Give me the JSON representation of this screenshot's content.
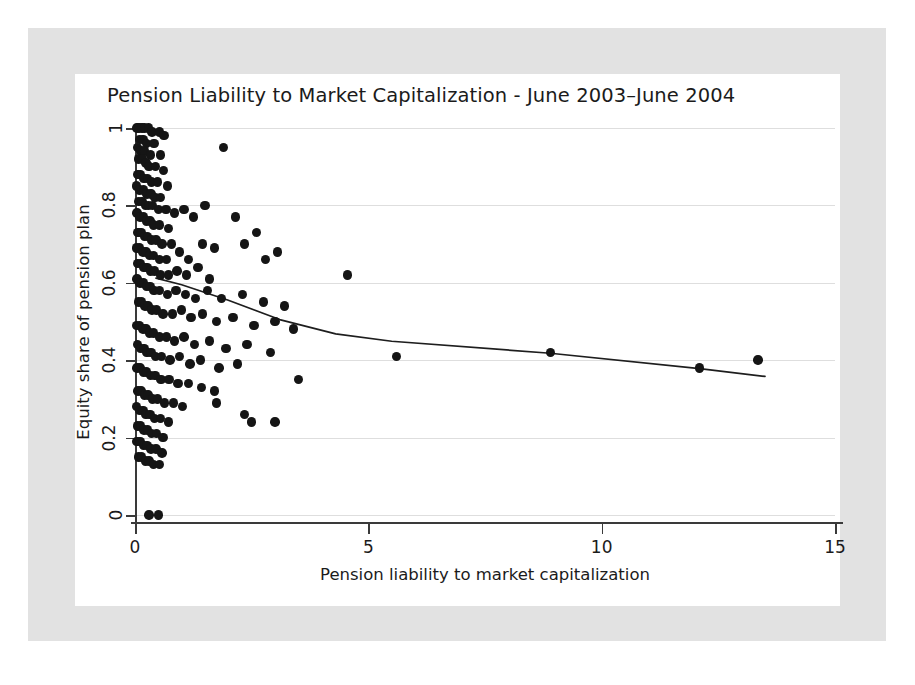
{
  "figure": {
    "title": "Pension Liability to Market Capitalization - June 2003–June 2004"
  },
  "chart_data": {
    "type": "scatter",
    "title": "Pension Liability to Market Capitalization - June 2003–June 2004",
    "xlabel": "Pension liability to market capitalization",
    "ylabel": "Equity share of pension plan",
    "xlim": [
      0,
      15
    ],
    "ylim": [
      0,
      1
    ],
    "xticks": [
      0,
      5,
      10,
      15
    ],
    "xticklabels": [
      "0",
      "5",
      "10",
      "15"
    ],
    "yticks": [
      0,
      0.2,
      0.4,
      0.6,
      0.8,
      1
    ],
    "yticklabels": [
      "0",
      "0.2",
      "0.4",
      "0.6",
      "0.8",
      "1"
    ],
    "grid": "horizontal",
    "legend": "none",
    "marker_color": "#151515",
    "line_color": "#1e1e1e",
    "series": [
      {
        "name": "Firms",
        "type": "scatter",
        "points": [
          [
            0.04,
            1.0
          ],
          [
            0.09,
            1.0
          ],
          [
            0.15,
            1.0
          ],
          [
            0.2,
            1.0
          ],
          [
            0.29,
            1.0
          ],
          [
            0.36,
            0.99
          ],
          [
            0.52,
            0.99
          ],
          [
            0.62,
            0.98
          ],
          [
            0.1,
            0.97
          ],
          [
            0.17,
            0.97
          ],
          [
            0.25,
            0.96
          ],
          [
            0.41,
            0.96
          ],
          [
            0.05,
            0.95
          ],
          [
            0.13,
            0.94
          ],
          [
            0.2,
            0.94
          ],
          [
            0.33,
            0.93
          ],
          [
            0.55,
            0.93
          ],
          [
            1.9,
            0.95
          ],
          [
            0.07,
            0.92
          ],
          [
            0.16,
            0.92
          ],
          [
            0.24,
            0.91
          ],
          [
            0.3,
            0.9
          ],
          [
            0.44,
            0.9
          ],
          [
            0.61,
            0.89
          ],
          [
            0.06,
            0.88
          ],
          [
            0.12,
            0.88
          ],
          [
            0.19,
            0.87
          ],
          [
            0.27,
            0.87
          ],
          [
            0.35,
            0.86
          ],
          [
            0.48,
            0.86
          ],
          [
            0.7,
            0.85
          ],
          [
            0.03,
            0.85
          ],
          [
            0.1,
            0.84
          ],
          [
            0.18,
            0.84
          ],
          [
            0.26,
            0.83
          ],
          [
            0.34,
            0.83
          ],
          [
            0.43,
            0.82
          ],
          [
            0.55,
            0.82
          ],
          [
            0.08,
            0.81
          ],
          [
            0.15,
            0.81
          ],
          [
            0.22,
            0.8
          ],
          [
            0.29,
            0.8
          ],
          [
            0.38,
            0.8
          ],
          [
            0.5,
            0.79
          ],
          [
            0.66,
            0.79
          ],
          [
            0.85,
            0.78
          ],
          [
            0.04,
            0.78
          ],
          [
            0.11,
            0.77
          ],
          [
            0.18,
            0.77
          ],
          [
            0.25,
            0.76
          ],
          [
            0.32,
            0.76
          ],
          [
            0.4,
            0.75
          ],
          [
            0.52,
            0.75
          ],
          [
            0.72,
            0.74
          ],
          [
            1.05,
            0.79
          ],
          [
            1.25,
            0.77
          ],
          [
            1.5,
            0.8
          ],
          [
            2.15,
            0.77
          ],
          [
            2.6,
            0.73
          ],
          [
            0.06,
            0.73
          ],
          [
            0.13,
            0.73
          ],
          [
            0.2,
            0.72
          ],
          [
            0.27,
            0.72
          ],
          [
            0.35,
            0.71
          ],
          [
            0.45,
            0.71
          ],
          [
            0.58,
            0.7
          ],
          [
            0.78,
            0.7
          ],
          [
            0.03,
            0.69
          ],
          [
            0.1,
            0.69
          ],
          [
            0.17,
            0.68
          ],
          [
            0.24,
            0.68
          ],
          [
            0.31,
            0.67
          ],
          [
            0.4,
            0.67
          ],
          [
            0.52,
            0.66
          ],
          [
            0.68,
            0.66
          ],
          [
            0.95,
            0.68
          ],
          [
            1.15,
            0.66
          ],
          [
            1.45,
            0.7
          ],
          [
            1.7,
            0.69
          ],
          [
            2.35,
            0.7
          ],
          [
            2.8,
            0.66
          ],
          [
            3.05,
            0.68
          ],
          [
            0.05,
            0.65
          ],
          [
            0.12,
            0.65
          ],
          [
            0.19,
            0.64
          ],
          [
            0.26,
            0.64
          ],
          [
            0.33,
            0.63
          ],
          [
            0.42,
            0.63
          ],
          [
            0.55,
            0.62
          ],
          [
            0.72,
            0.62
          ],
          [
            0.9,
            0.63
          ],
          [
            1.1,
            0.62
          ],
          [
            1.35,
            0.64
          ],
          [
            1.6,
            0.61
          ],
          [
            4.55,
            0.62
          ],
          [
            0.04,
            0.61
          ],
          [
            0.11,
            0.6
          ],
          [
            0.18,
            0.6
          ],
          [
            0.25,
            0.59
          ],
          [
            0.32,
            0.59
          ],
          [
            0.41,
            0.58
          ],
          [
            0.53,
            0.58
          ],
          [
            0.7,
            0.57
          ],
          [
            0.88,
            0.58
          ],
          [
            1.08,
            0.57
          ],
          [
            1.3,
            0.56
          ],
          [
            1.55,
            0.58
          ],
          [
            1.85,
            0.56
          ],
          [
            2.3,
            0.57
          ],
          [
            2.75,
            0.55
          ],
          [
            3.2,
            0.54
          ],
          [
            0.07,
            0.55
          ],
          [
            0.14,
            0.55
          ],
          [
            0.21,
            0.54
          ],
          [
            0.28,
            0.54
          ],
          [
            0.36,
            0.53
          ],
          [
            0.46,
            0.53
          ],
          [
            0.6,
            0.52
          ],
          [
            0.8,
            0.52
          ],
          [
            1.0,
            0.53
          ],
          [
            1.2,
            0.51
          ],
          [
            1.45,
            0.52
          ],
          [
            1.75,
            0.5
          ],
          [
            2.1,
            0.51
          ],
          [
            2.55,
            0.49
          ],
          [
            3.0,
            0.5
          ],
          [
            3.4,
            0.48
          ],
          [
            5.6,
            0.41
          ],
          [
            8.9,
            0.42
          ],
          [
            12.1,
            0.38
          ],
          [
            13.35,
            0.4
          ],
          [
            0.03,
            0.49
          ],
          [
            0.1,
            0.49
          ],
          [
            0.17,
            0.48
          ],
          [
            0.24,
            0.48
          ],
          [
            0.31,
            0.47
          ],
          [
            0.4,
            0.47
          ],
          [
            0.52,
            0.46
          ],
          [
            0.68,
            0.46
          ],
          [
            0.85,
            0.45
          ],
          [
            1.05,
            0.46
          ],
          [
            1.28,
            0.44
          ],
          [
            1.6,
            0.45
          ],
          [
            1.95,
            0.43
          ],
          [
            2.4,
            0.44
          ],
          [
            2.9,
            0.42
          ],
          [
            0.05,
            0.44
          ],
          [
            0.12,
            0.43
          ],
          [
            0.19,
            0.43
          ],
          [
            0.26,
            0.42
          ],
          [
            0.34,
            0.42
          ],
          [
            0.44,
            0.41
          ],
          [
            0.57,
            0.41
          ],
          [
            0.75,
            0.4
          ],
          [
            0.95,
            0.41
          ],
          [
            1.18,
            0.39
          ],
          [
            1.4,
            0.4
          ],
          [
            1.8,
            0.38
          ],
          [
            2.2,
            0.39
          ],
          [
            3.5,
            0.35
          ],
          [
            0.04,
            0.38
          ],
          [
            0.11,
            0.38
          ],
          [
            0.18,
            0.37
          ],
          [
            0.25,
            0.37
          ],
          [
            0.33,
            0.36
          ],
          [
            0.43,
            0.36
          ],
          [
            0.56,
            0.35
          ],
          [
            0.73,
            0.35
          ],
          [
            0.92,
            0.34
          ],
          [
            1.15,
            0.34
          ],
          [
            1.42,
            0.33
          ],
          [
            1.7,
            0.32
          ],
          [
            0.06,
            0.32
          ],
          [
            0.13,
            0.32
          ],
          [
            0.2,
            0.31
          ],
          [
            0.28,
            0.31
          ],
          [
            0.37,
            0.3
          ],
          [
            0.48,
            0.3
          ],
          [
            0.63,
            0.29
          ],
          [
            0.82,
            0.29
          ],
          [
            1.02,
            0.28
          ],
          [
            1.75,
            0.29
          ],
          [
            0.03,
            0.28
          ],
          [
            0.1,
            0.27
          ],
          [
            0.17,
            0.27
          ],
          [
            0.24,
            0.26
          ],
          [
            0.32,
            0.26
          ],
          [
            0.42,
            0.25
          ],
          [
            0.55,
            0.25
          ],
          [
            0.72,
            0.24
          ],
          [
            2.5,
            0.24
          ],
          [
            3.0,
            0.24
          ],
          [
            0.05,
            0.23
          ],
          [
            0.12,
            0.23
          ],
          [
            0.19,
            0.22
          ],
          [
            0.27,
            0.22
          ],
          [
            0.35,
            0.21
          ],
          [
            0.46,
            0.21
          ],
          [
            0.6,
            0.2
          ],
          [
            2.35,
            0.26
          ],
          [
            0.04,
            0.19
          ],
          [
            0.11,
            0.19
          ],
          [
            0.18,
            0.18
          ],
          [
            0.26,
            0.18
          ],
          [
            0.34,
            0.17
          ],
          [
            0.45,
            0.17
          ],
          [
            0.58,
            0.16
          ],
          [
            0.07,
            0.15
          ],
          [
            0.14,
            0.15
          ],
          [
            0.22,
            0.14
          ],
          [
            0.3,
            0.14
          ],
          [
            0.4,
            0.13
          ],
          [
            0.52,
            0.13
          ],
          [
            0.3,
            0.0
          ],
          [
            0.5,
            0.0
          ]
        ]
      },
      {
        "name": "Mean equity share (binned)",
        "type": "line",
        "points": [
          [
            0.45,
            0.612
          ],
          [
            1.0,
            0.595
          ],
          [
            2.0,
            0.555
          ],
          [
            3.1,
            0.505
          ],
          [
            4.3,
            0.468
          ],
          [
            5.5,
            0.449
          ],
          [
            8.9,
            0.418
          ],
          [
            12.1,
            0.378
          ],
          [
            13.5,
            0.358
          ]
        ]
      }
    ]
  }
}
